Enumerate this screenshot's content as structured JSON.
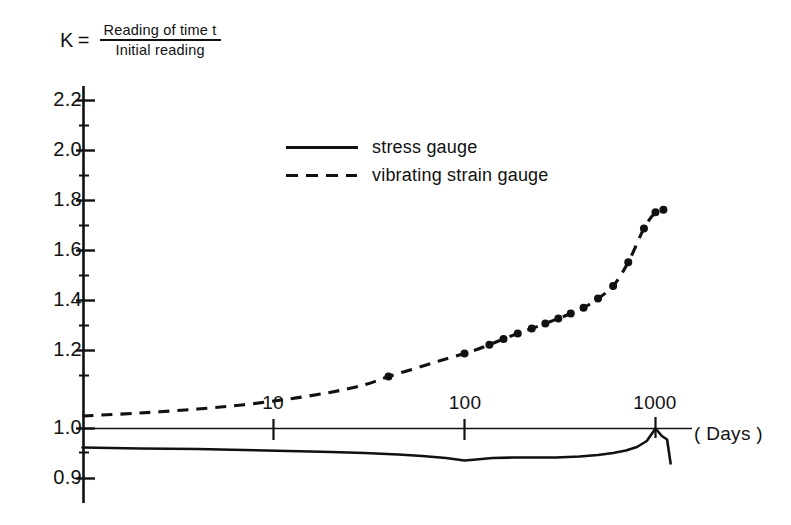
{
  "title": {
    "symbol": "K",
    "equals": "=",
    "numerator": "Reading  of  time  t",
    "denominator": "Initial   reading"
  },
  "legend": {
    "position": "inside-upper-left",
    "items": [
      {
        "label": "stress  gauge",
        "style": "solid",
        "key": "stress-gauge"
      },
      {
        "label": "vibrating  strain  gauge",
        "style": "dashed",
        "key": "vibrating-strain-gauge"
      }
    ]
  },
  "axes": {
    "y": {
      "label": "K",
      "ticks": [
        "2.2",
        "2.0",
        "1.8",
        "1.6",
        "1.4",
        "1.2",
        "1.0",
        "0.9"
      ],
      "tick_values": [
        2.2,
        2.0,
        1.8,
        1.6,
        1.4,
        1.2,
        1.0,
        0.9
      ],
      "minor_ticks": [
        2.1,
        1.9,
        1.7,
        1.5,
        1.3,
        1.1,
        0.95
      ],
      "scale": "linear-with-break-below-1.0"
    },
    "x": {
      "title": "( Days )",
      "ticks": [
        "10",
        "100",
        "1000"
      ],
      "tick_values": [
        10,
        100,
        1000
      ],
      "scale": "log10",
      "range": [
        1,
        2000
      ]
    }
  },
  "chart_data": {
    "type": "line",
    "xlabel": "( Days )",
    "ylabel": "K",
    "xscale": "log",
    "xlim": [
      1,
      2000
    ],
    "ylim": [
      0.88,
      2.3
    ],
    "grid": false,
    "legend_position": "upper left inside",
    "series": [
      {
        "name": "stress  gauge",
        "style": "solid",
        "markers": false,
        "color": "#111111",
        "x": [
          1,
          2,
          4,
          7,
          12,
          20,
          30,
          45,
          60,
          80,
          100,
          115,
          140,
          180,
          230,
          300,
          400,
          500,
          600,
          700,
          800,
          900,
          1000,
          1080,
          1150,
          1200
        ],
        "y": [
          0.962,
          0.96,
          0.959,
          0.957,
          0.955,
          0.953,
          0.951,
          0.948,
          0.945,
          0.941,
          0.936,
          0.938,
          0.941,
          0.942,
          0.942,
          0.942,
          0.944,
          0.947,
          0.951,
          0.956,
          0.963,
          0.975,
          1.0,
          0.985,
          0.978,
          0.93
        ]
      },
      {
        "name": "vibrating  strain  gauge",
        "style": "dashed",
        "markers": true,
        "color": "#111111",
        "x": [
          1,
          2,
          4,
          7,
          12,
          20,
          30,
          40,
          55,
          75,
          100,
          115,
          135,
          160,
          190,
          225,
          265,
          310,
          360,
          420,
          500,
          600,
          720,
          870,
          1000,
          1100
        ],
        "y": [
          1.05,
          1.062,
          1.078,
          1.095,
          1.118,
          1.145,
          1.175,
          1.208,
          1.24,
          1.272,
          1.3,
          1.315,
          1.335,
          1.358,
          1.38,
          1.4,
          1.42,
          1.44,
          1.46,
          1.483,
          1.52,
          1.57,
          1.665,
          1.8,
          1.865,
          1.875
        ]
      }
    ],
    "data_points": {
      "series": "vibrating  strain  gauge",
      "x": [
        40,
        100,
        135,
        160,
        190,
        225,
        265,
        310,
        360,
        420,
        500,
        600,
        720,
        870,
        1000,
        1100
      ],
      "y": [
        1.208,
        1.3,
        1.335,
        1.358,
        1.38,
        1.4,
        1.42,
        1.44,
        1.46,
        1.483,
        1.52,
        1.57,
        1.665,
        1.8,
        1.865,
        1.875
      ]
    },
    "annotations": []
  }
}
